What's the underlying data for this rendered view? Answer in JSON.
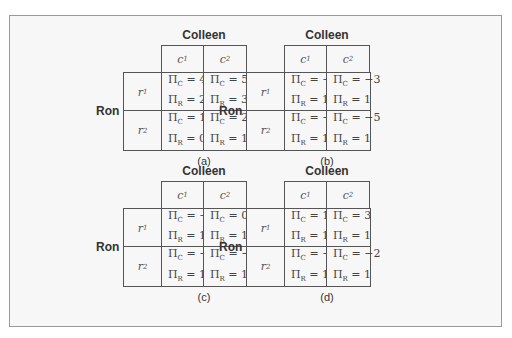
{
  "panels": [
    {
      "label": "(a)",
      "column_player": "Colleen",
      "row_player": "Ron",
      "columns": [
        "c1",
        "c2"
      ],
      "rows": [
        "r1",
        "r2"
      ],
      "payoffs": [
        [
          {
            "PiC": "4",
            "PiR": "2"
          },
          {
            "PiC": "5",
            "PiR": "3"
          }
        ],
        [
          {
            "PiC": "1",
            "PiR": "0"
          },
          {
            "PiC": "2",
            "PiR": "1"
          }
        ]
      ]
    },
    {
      "label": "(b)",
      "column_player": "Colleen",
      "row_player": "Ron",
      "columns": [
        "c1",
        "c2"
      ],
      "rows": [
        "r1",
        "r2"
      ],
      "payoffs": [
        [
          {
            "PiC": "−2",
            "PiR": "1"
          },
          {
            "PiC": "−3",
            "PiR": "1"
          }
        ],
        [
          {
            "PiC": "−4",
            "PiR": "1"
          },
          {
            "PiC": "−5",
            "PiR": "1"
          }
        ]
      ]
    },
    {
      "label": "(c)",
      "column_player": "Colleen",
      "row_player": "Ron",
      "columns": [
        "c1",
        "c2"
      ],
      "rows": [
        "r1",
        "r2"
      ],
      "payoffs": [
        [
          {
            "PiC": "−2",
            "PiR": "1"
          },
          {
            "PiC": "0",
            "PiR": "1"
          }
        ],
        [
          {
            "PiC": "−4",
            "PiR": "1"
          },
          {
            "PiC": "−5",
            "PiR": "1"
          }
        ]
      ]
    },
    {
      "label": "(d)",
      "column_player": "Colleen",
      "row_player": "Ron",
      "columns": [
        "c1",
        "c2"
      ],
      "rows": [
        "r1",
        "r2"
      ],
      "payoffs": [
        [
          {
            "PiC": "1",
            "PiR": "1"
          },
          {
            "PiC": "3",
            "PiR": "1"
          }
        ],
        [
          {
            "PiC": "−1",
            "PiR": "1"
          },
          {
            "PiC": "−2",
            "PiR": "1"
          }
        ]
      ]
    }
  ],
  "symbols": {
    "pi": "Π",
    "sub_c": "C",
    "sub_r": "R",
    "eq": " = "
  }
}
